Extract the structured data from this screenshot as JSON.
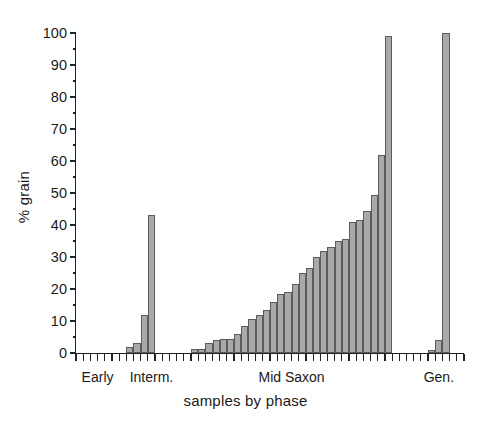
{
  "chart_data": {
    "type": "bar",
    "title": "",
    "xlabel": "samples by phase",
    "ylabel": "% grain",
    "ylim": [
      0,
      100
    ],
    "ytick_step": 10,
    "yminor_step": 5,
    "grid": false,
    "legend": false,
    "ytick_labels": [
      "0",
      "10",
      "20",
      "30",
      "40",
      "50",
      "60",
      "70",
      "80",
      "90",
      "100"
    ],
    "ytick_values": [
      0,
      10,
      20,
      30,
      40,
      50,
      60,
      70,
      80,
      90,
      100
    ],
    "bar_fill": "#a9a9a9",
    "bar_edge": "#5c5c5c",
    "axis_color": "#222222",
    "n_slots": 54,
    "category_labels": [
      {
        "text": "Early",
        "slot": 3.0
      },
      {
        "text": "Interm.",
        "slot": 10.5
      },
      {
        "text": "Mid Saxon",
        "slot": 30.0
      },
      {
        "text": "Gen.",
        "slot": 50.5
      }
    ],
    "categories": [
      "E1",
      "E2",
      "E3",
      "E4",
      "E5",
      "E6",
      "E7",
      "I1",
      "I2",
      "I3",
      "I4",
      "M1",
      "M2",
      "M3",
      "M4",
      "M5",
      "M6",
      "M7",
      "M8",
      "M9",
      "M10",
      "M11",
      "M12",
      "M13",
      "M14",
      "M15",
      "M16",
      "M17",
      "M18",
      "M19",
      "M20",
      "M21",
      "M22",
      "M23",
      "M24",
      "M25",
      "M26",
      "M27",
      "M28",
      "M29",
      "M30",
      "M31",
      "M32",
      "M33",
      "M34",
      "M35",
      "M36",
      "G1",
      "G2",
      "G3",
      "G4",
      "G5",
      "G6",
      "G7"
    ],
    "values": [
      0,
      0,
      0,
      0,
      0,
      0,
      0,
      2,
      3.2,
      12,
      43,
      0,
      0,
      0,
      0,
      0,
      1.2,
      1.4,
      3.2,
      4,
      4.4,
      4.4,
      6,
      8.5,
      10.5,
      12,
      13.5,
      16,
      18.5,
      19,
      21.5,
      25,
      26.5,
      30,
      32,
      33,
      35,
      35.5,
      41,
      41.5,
      44.5,
      49.5,
      62,
      99,
      0,
      0,
      0,
      0,
      0,
      1,
      4,
      100,
      0,
      0
    ]
  }
}
